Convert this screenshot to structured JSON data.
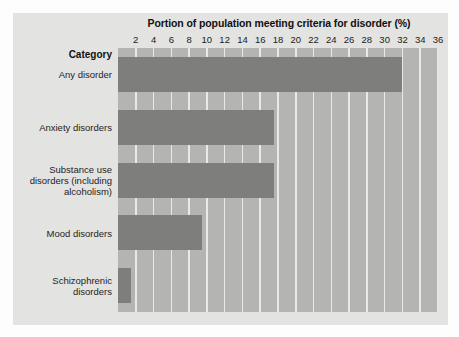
{
  "chart_data": {
    "type": "bar",
    "orientation": "horizontal",
    "title": "Portion of population meeting criteria for disorder (%)",
    "xlabel": "Portion of population meeting criteria for disorder (%)",
    "ylabel": "Category",
    "category_header": "Category",
    "categories": [
      "Any disorder",
      "Anxiety disorders",
      "Substance use disorders (including alcoholism)",
      "Mood disorders",
      "Schizophrenic disorders"
    ],
    "values": [
      32,
      17.5,
      17.5,
      9.5,
      1.5
    ],
    "xlim": [
      0,
      36
    ],
    "xticks": [
      2,
      4,
      6,
      8,
      10,
      12,
      14,
      16,
      18,
      20,
      22,
      24,
      26,
      28,
      30,
      32,
      34,
      36
    ],
    "xtick_labels": [
      "2",
      "4",
      "6",
      "8",
      "10",
      "12",
      "14",
      "16",
      "18",
      "20",
      "22",
      "24",
      "26",
      "28",
      "30",
      "32",
      "34",
      "36"
    ],
    "grid": true,
    "legend": null,
    "colors": {
      "bar": "#7e7e7c",
      "plot_background": "#b4b4b2",
      "gridline": "#e9e9e7",
      "panel_background": "#e3e3e1",
      "page_background": "#fdfdfd",
      "text": "#1d1d1d"
    }
  }
}
